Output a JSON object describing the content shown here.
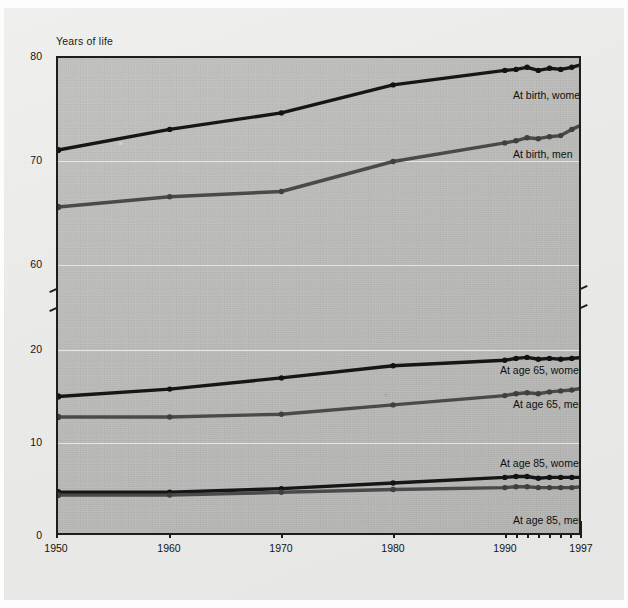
{
  "chart_data": {
    "type": "line",
    "title": "Years of life",
    "xlabel": "",
    "ylabel": "Years of life",
    "grid": true,
    "legend_position": "inline-right",
    "axis_break": true,
    "upper_axis_range": [
      58,
      80
    ],
    "lower_axis_range": [
      0,
      22
    ],
    "ylim": [
      0,
      80
    ],
    "ytick_labels": [
      "80",
      "70",
      "60",
      "20",
      "10",
      "0"
    ],
    "ytick_values": [
      80,
      70,
      60,
      20,
      10,
      0
    ],
    "xlim": [
      1950,
      1997
    ],
    "xtick_labels": [
      "1950",
      "1960",
      "1970",
      "1980",
      "1990",
      "1997"
    ],
    "xtick_values": [
      1950,
      1960,
      1970,
      1980,
      1990,
      1997
    ],
    "minor_xticks": [
      1990,
      1991,
      1992,
      1993,
      1994,
      1995,
      1996,
      1997
    ],
    "x": [
      1950,
      1960,
      1970,
      1980,
      1990,
      1991,
      1992,
      1993,
      1994,
      1995,
      1996,
      1997
    ],
    "series": [
      {
        "name": "At birth, women",
        "label": "At birth, women",
        "color": "#161616",
        "values": [
          71.1,
          73.1,
          74.7,
          77.4,
          78.8,
          78.9,
          79.1,
          78.8,
          79.0,
          78.9,
          79.1,
          79.4
        ]
      },
      {
        "name": "At birth, men",
        "label": "At birth, men",
        "color": "#4a4a4a",
        "values": [
          65.6,
          66.6,
          67.1,
          70.0,
          71.8,
          72.0,
          72.3,
          72.2,
          72.4,
          72.5,
          73.1,
          73.6
        ]
      },
      {
        "name": "At age 65, women",
        "label": "At age 65, women",
        "color": "#161616",
        "values": [
          15.0,
          15.8,
          17.0,
          18.3,
          18.9,
          19.1,
          19.2,
          19.0,
          19.1,
          19.0,
          19.1,
          19.2
        ]
      },
      {
        "name": "At age 65, men",
        "label": "At age 65, men",
        "color": "#4a4a4a",
        "values": [
          12.8,
          12.8,
          13.1,
          14.1,
          15.1,
          15.3,
          15.4,
          15.3,
          15.5,
          15.6,
          15.7,
          15.9
        ]
      },
      {
        "name": "At age 85, women",
        "label": "At age 85, women",
        "color": "#161616",
        "values": [
          4.7,
          4.7,
          5.1,
          5.7,
          6.3,
          6.4,
          6.4,
          6.2,
          6.3,
          6.3,
          6.3,
          6.3
        ]
      },
      {
        "name": "At age 85, men",
        "label": "At age 85, men",
        "color": "#4a4a4a",
        "values": [
          4.4,
          4.4,
          4.7,
          5.0,
          5.2,
          5.3,
          5.3,
          5.2,
          5.2,
          5.2,
          5.2,
          5.3
        ]
      }
    ]
  },
  "axis": {
    "y_title": "Years of life",
    "y_labels": [
      "80",
      "70",
      "60",
      "20",
      "10",
      "0"
    ],
    "x_labels": [
      "1950",
      "1960",
      "1970",
      "1980",
      "1990",
      "1997"
    ]
  },
  "labels": {
    "birth_women": "At birth, women",
    "birth_men": "At birth, men",
    "age65_women": "At age 65, women",
    "age65_men": "At age 65, men",
    "age85_women": "At age 85, women",
    "age85_men": "At age 85, men"
  },
  "colors": {
    "women_line": "#161616",
    "men_line": "#4a4a4a",
    "plot_background": "#bcbcba",
    "paper_background": "#ececea",
    "gridline": "#efefee",
    "frame": "#1d1d1d"
  }
}
